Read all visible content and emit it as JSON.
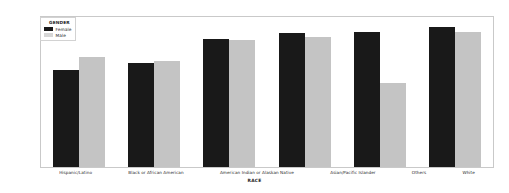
{
  "chart_data": {
    "type": "bar",
    "title": "",
    "subtitle": "",
    "xlabel": "RACE",
    "ylabel": "",
    "categories": [
      "Hispanic/Latino",
      "Black or African American",
      "American Indian or Alaskan Native",
      "Asian/Pacific Islander",
      "Others",
      "White"
    ],
    "series": [
      {
        "name": "Female",
        "color": "#191919",
        "values": [
          45500,
          48700,
          59800,
          62600,
          63000,
          65400
        ]
      },
      {
        "name": "Male",
        "color": "#c4c4c4",
        "values": [
          51500,
          49600,
          59300,
          60700,
          39000,
          63000
        ]
      }
    ],
    "ylim": [
      0,
      70000
    ],
    "yticks": [
      0,
      10000,
      20000,
      30000,
      40000,
      50000,
      60000,
      70000
    ],
    "ytick_labels": [
      "0",
      "10000",
      "20000",
      "30000",
      "40000",
      "50000",
      "60000",
      "70000"
    ],
    "grid": false,
    "legend_position": "upper-left",
    "bar_mode": "grouped"
  },
  "legend": {
    "title": "GENDER",
    "entries": [
      {
        "label": "Female",
        "swatch": "female-legend-swatch"
      },
      {
        "label": "Male",
        "swatch": "male-legend-swatch"
      }
    ]
  },
  "axes": {
    "x_title": "RACE"
  }
}
